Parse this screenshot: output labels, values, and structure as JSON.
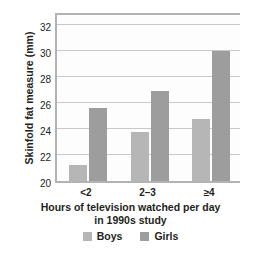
{
  "chart_data": {
    "type": "bar",
    "title": "",
    "categories": [
      "<2",
      "2–3",
      "≥4"
    ],
    "series": [
      {
        "name": "Boys",
        "color": "#b6b6b6",
        "values": [
          21.2,
          23.8,
          24.8
        ]
      },
      {
        "name": "Girls",
        "color": "#9d9d9d",
        "values": [
          25.6,
          26.9,
          30.0
        ]
      }
    ],
    "xlabel": "Hours of television watched per day in 1990s study",
    "xlabel_line1": "Hours of television watched per day",
    "xlabel_line2": "in 1990s study",
    "ylabel": "Skinfold fat measure (mm)",
    "ylim": [
      20,
      33.1
    ],
    "yticks": [
      20,
      22,
      24,
      26,
      28,
      30,
      32
    ],
    "ytick_labels": [
      "20",
      "22",
      "24",
      "26",
      "28",
      "30",
      "32"
    ],
    "grid": true,
    "legend_position": "bottom"
  },
  "legend": {
    "items": [
      {
        "label": "Boys",
        "color": "#b6b6b6"
      },
      {
        "label": "Girls",
        "color": "#9d9d9d"
      }
    ]
  },
  "colors": {
    "boys": "#b6b6b6",
    "girls": "#9d9d9d",
    "axis": "#b3b3b3",
    "grid": "#c9c9c9",
    "text": "#231f20",
    "background": "#ffffff"
  }
}
